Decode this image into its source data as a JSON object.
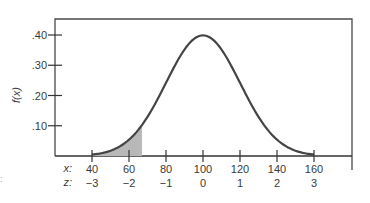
{
  "chart_data": {
    "type": "area",
    "title": "",
    "ylabel": "f(x)",
    "xlabel": "",
    "distribution": {
      "name": "normal",
      "mean": 100,
      "sd": 20
    },
    "x_axis": {
      "row_labels": [
        "x:",
        "z:"
      ],
      "ticks_x": [
        40,
        60,
        80,
        100,
        120,
        140,
        160
      ],
      "ticks_z": [
        "−3",
        "−2",
        "−1",
        "0",
        "1",
        "2",
        "3"
      ]
    },
    "y_axis": {
      "ticks": [
        0.1,
        0.2,
        0.3,
        0.4
      ],
      "tick_labels": [
        ".10",
        ".20",
        ".30",
        ".40"
      ],
      "ylim": [
        0,
        0.45
      ]
    },
    "curve": {
      "x": [
        40,
        50,
        60,
        70,
        80,
        90,
        100,
        110,
        120,
        130,
        140,
        150,
        160
      ],
      "f_scaled": [
        0.004,
        0.018,
        0.054,
        0.13,
        0.242,
        0.352,
        0.399,
        0.352,
        0.242,
        0.13,
        0.054,
        0.018,
        0.004
      ]
    },
    "shaded_region": {
      "from_x": 40,
      "to_x": 67,
      "color": "#b8b8b8"
    },
    "grid": false,
    "legend": null,
    "colors": {
      "curve": "#444444",
      "axis": "#333333",
      "shade": "#b8b8b8"
    }
  },
  "stray_mark": ":"
}
